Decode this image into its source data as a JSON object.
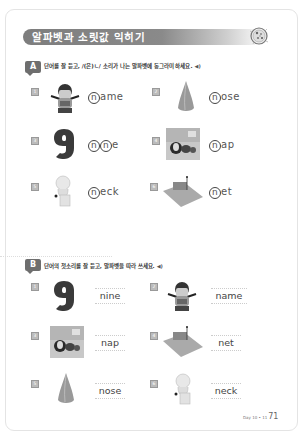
{
  "header": {
    "title": "알파벳과 소릿값 익히기",
    "icon": "pizza-icon"
  },
  "sectionA": {
    "badge": "A",
    "instruction": "단어를 잘 듣고, /(은)ㄴ/ 소리가 나는 알파벳에 동그라미 하세요.",
    "speaker_icon": "speaker-icon",
    "items": [
      {
        "num": "1",
        "picture": "girl-name-tag",
        "circled": "n",
        "rest": "ame"
      },
      {
        "num": "2",
        "picture": "nose",
        "circled": "n",
        "rest": "ose"
      },
      {
        "num": "3",
        "picture": "number-nine",
        "circled": "n",
        "rest": "e",
        "second_circled": "n"
      },
      {
        "num": "4",
        "picture": "napping-child",
        "circled": "n",
        "rest": "ap"
      },
      {
        "num": "5",
        "picture": "statue-bust",
        "circled": "n",
        "rest": "eck"
      },
      {
        "num": "6",
        "picture": "tennis-net",
        "circled": "n",
        "rest": "et"
      }
    ]
  },
  "sectionB": {
    "badge": "B",
    "instruction": "단어의 첫소리를 잘 듣고, 알파벳을 따라 쓰세요.",
    "speaker_icon": "speaker-icon",
    "items": [
      {
        "num": "1",
        "picture": "number-nine",
        "word": "nine"
      },
      {
        "num": "2",
        "picture": "girl-name-tag",
        "word": "name"
      },
      {
        "num": "3",
        "picture": "napping-child",
        "word": "nap"
      },
      {
        "num": "4",
        "picture": "tennis-net",
        "word": "net"
      },
      {
        "num": "5",
        "picture": "nose",
        "word": "nose"
      },
      {
        "num": "6",
        "picture": "statue-bust",
        "word": "neck"
      }
    ]
  },
  "footer": {
    "label": "Day 10 • 11",
    "page": "71"
  }
}
